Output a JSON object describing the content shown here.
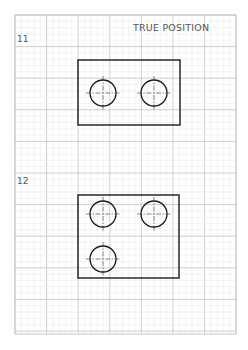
{
  "title": "TRUE POSITION",
  "colors": {
    "background": "#ffffff",
    "grid_minor": "#ececec",
    "grid_major": "#c8c8c8",
    "ink": "#1a1a1a",
    "label": "#555555",
    "centerline": "#333333"
  },
  "grid": {
    "x": 15,
    "y": 15,
    "width": 221,
    "height": 319,
    "major_spacing": 31.6,
    "minor_divisions": 5
  },
  "problems": [
    {
      "number": "11",
      "label_pos": [
        17,
        42
      ],
      "rect": {
        "x": 78,
        "y": 60,
        "w": 102,
        "h": 65
      },
      "holes": [
        {
          "cx": 103,
          "cy": 93,
          "r": 13
        },
        {
          "cx": 154,
          "cy": 93,
          "r": 13
        }
      ]
    },
    {
      "number": "12",
      "label_pos": [
        17,
        184
      ],
      "rect": {
        "x": 78,
        "y": 195,
        "w": 101,
        "h": 83
      },
      "holes": [
        {
          "cx": 103,
          "cy": 214,
          "r": 13
        },
        {
          "cx": 154,
          "cy": 214,
          "r": 13
        },
        {
          "cx": 103,
          "cy": 259,
          "r": 13
        }
      ]
    }
  ]
}
